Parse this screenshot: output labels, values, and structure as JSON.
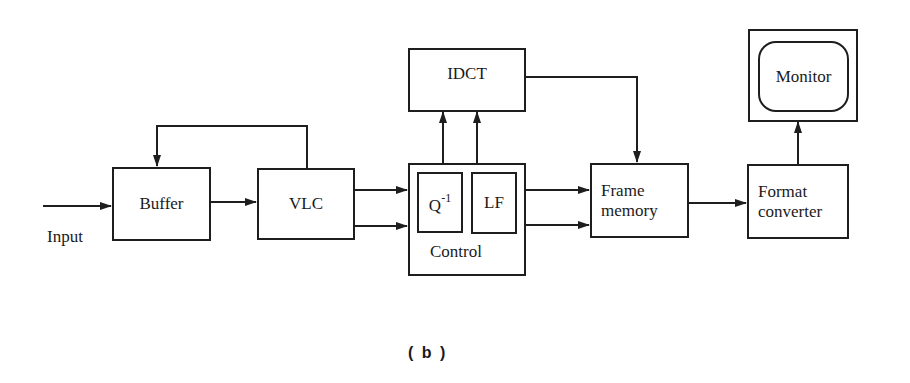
{
  "figure": {
    "caption": "( b )",
    "input_label": "Input",
    "blocks": {
      "buffer": "Buffer",
      "vlc": "VLC",
      "idct": "IDCT",
      "control": "Control",
      "q_inverse_base": "Q",
      "q_inverse_sup": "-1",
      "lf": "LF",
      "frame_memory_line1": "Frame",
      "frame_memory_line2": "memory",
      "format_converter_line1": "Format",
      "format_converter_line2": "converter",
      "monitor": "Monitor"
    },
    "connections": [
      {
        "from": "Input",
        "to": "Buffer"
      },
      {
        "from": "Buffer",
        "to": "VLC"
      },
      {
        "from": "VLC",
        "to": "Buffer",
        "type": "feedback"
      },
      {
        "from": "VLC",
        "to": "Control",
        "count": 2
      },
      {
        "from": "Control",
        "to": "IDCT",
        "count": 2
      },
      {
        "from": "IDCT",
        "to": "Frame memory"
      },
      {
        "from": "Control",
        "to": "Frame memory",
        "count": 2
      },
      {
        "from": "Frame memory",
        "to": "Format converter"
      },
      {
        "from": "Format converter",
        "to": "Monitor"
      }
    ],
    "colors": {
      "line": "#1e1e1e",
      "background": "#ffffff"
    }
  }
}
